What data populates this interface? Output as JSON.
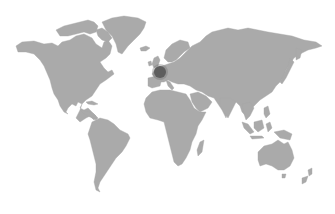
{
  "map": {
    "type": "world-map",
    "land_color": "#aaaaaa",
    "background_color": "#ffffff",
    "marker": {
      "label": "Central Europe (France/Switzerland region)",
      "color": "#595959",
      "x": 160,
      "y": 72,
      "radius": 6
    },
    "regions": [
      "north-america",
      "greenland",
      "south-america",
      "europe",
      "africa",
      "asia",
      "australia",
      "new-zealand",
      "madagascar",
      "japan",
      "indonesia",
      "uk-ireland",
      "iceland"
    ]
  }
}
